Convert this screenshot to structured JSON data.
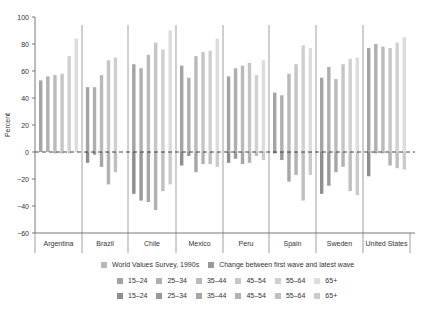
{
  "chart_data": {
    "type": "bar",
    "title": "",
    "xlabel": "",
    "ylabel": "Percent",
    "ylim": [
      -60,
      100
    ],
    "yticks": [
      100,
      80,
      60,
      40,
      20,
      0,
      -20,
      -40,
      -60
    ],
    "grid": false,
    "legend_position": "bottom",
    "categories": [
      "Argentina",
      "Brazil",
      "Chile",
      "Mexico",
      "Peru",
      "Spain",
      "Sweden",
      "United States"
    ],
    "age_groups": [
      "15–24",
      "25–34",
      "35–44",
      "45–54",
      "55–64",
      "65+"
    ],
    "series_groups": [
      {
        "name": "World Values Survey, 1990s",
        "colors": [
          "#a4a4a4",
          "#afafaf",
          "#bababa",
          "#c5c5c5",
          "#d0d0d0",
          "#dcdcdc"
        ],
        "values": {
          "Argentina": [
            53,
            56,
            57,
            58,
            71,
            84
          ],
          "Brazil": [
            48,
            48,
            57,
            68,
            70,
            null
          ],
          "Chile": [
            65,
            62,
            72,
            81,
            76,
            90
          ],
          "Mexico": [
            64,
            55,
            71,
            74,
            75,
            84
          ],
          "Peru": [
            56,
            62,
            64,
            66,
            57,
            68
          ],
          "Spain": [
            44,
            42,
            58,
            65,
            79,
            77
          ],
          "Sweden": [
            55,
            63,
            54,
            65,
            69,
            70
          ],
          "United States": [
            77,
            80,
            78,
            77,
            81,
            85
          ]
        }
      },
      {
        "name": "Change between first wave and latest wave",
        "colors": [
          "#8e8e8e",
          "#999999",
          "#a6a6a6",
          "#b2b2b2",
          "#bfbfbf",
          "#cbcbcb"
        ],
        "values": {
          "Argentina": [
            0,
            0,
            -1,
            -1,
            -1,
            0
          ],
          "Brazil": [
            -8,
            -2,
            -11,
            -24,
            -15,
            null
          ],
          "Chile": [
            -31,
            -36,
            -37,
            -43,
            -29,
            -24
          ],
          "Mexico": [
            -10,
            -3,
            -15,
            -9,
            -9,
            -11
          ],
          "Peru": [
            -8,
            -5,
            -9,
            -8,
            -3,
            -6
          ],
          "Spain": [
            -1,
            -6,
            -22,
            -17,
            -36,
            -17
          ],
          "Sweden": [
            -31,
            -25,
            -15,
            -11,
            -29,
            -32
          ],
          "United States": [
            -18,
            -1,
            -1,
            -10,
            -12,
            -13
          ]
        }
      }
    ]
  },
  "legend": {
    "header": [
      "World Values Survey, 1990s",
      "Change between first wave and latest wave"
    ],
    "row1": [
      "15–24",
      "25–34",
      "35–44",
      "45–54",
      "55–64",
      "65+"
    ],
    "row2": [
      "15–24",
      "25–34",
      "35–44",
      "45–54",
      "55–64",
      "65+"
    ]
  }
}
